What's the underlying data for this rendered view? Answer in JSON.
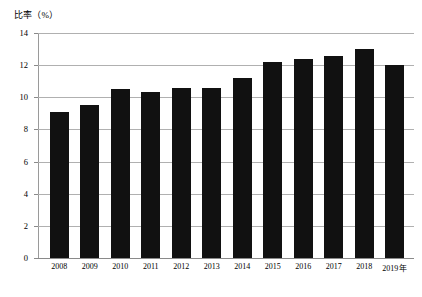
{
  "chart_data": {
    "type": "bar",
    "title": "",
    "subtitle": "",
    "ylabel": "比率（%）",
    "xlabel": "年",
    "categories": [
      "2008",
      "2009",
      "2010",
      "2011",
      "2012",
      "2013",
      "2014",
      "2015",
      "2016",
      "2017",
      "2018",
      "2019"
    ],
    "values": [
      9.1,
      9.5,
      10.5,
      10.3,
      10.6,
      10.6,
      11.2,
      12.2,
      12.4,
      12.6,
      13.0,
      12.0
    ],
    "series": [
      {
        "name": "比率（%）",
        "values": [
          9.1,
          9.5,
          10.5,
          10.3,
          10.6,
          10.6,
          11.2,
          12.2,
          12.4,
          12.6,
          13.0,
          12.0
        ]
      }
    ],
    "ylim": [
      0,
      14
    ],
    "ytick_labels": [
      "0",
      "2",
      "4",
      "6",
      "8",
      "10",
      "12",
      "14"
    ],
    "ytick_values": [
      0,
      2,
      4,
      6,
      8,
      10,
      12,
      14
    ],
    "xtick_labels": [
      "2008",
      "2009",
      "2010",
      "2011",
      "2012",
      "2013",
      "2014",
      "2015",
      "2016",
      "2017",
      "2018",
      "2019"
    ],
    "x_axis_unit_suffix": "年",
    "grid": true,
    "grid_orientation": "horizontal",
    "legend": false,
    "legend_position": "none",
    "bar_color": "#111111",
    "grid_color": "#b0b0b0",
    "axis_color": "#8a8a8a",
    "background_color": "#ffffff",
    "annotations": []
  },
  "axis": {
    "y_caption": "比率（%）"
  }
}
